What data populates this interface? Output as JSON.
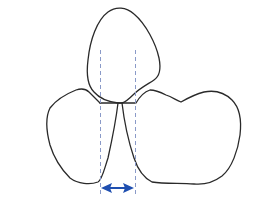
{
  "diagram": {
    "colors": {
      "outline": "#2a2a2a",
      "guide": "#8a9ac8",
      "arrow": "#1f4fb0",
      "background": "#ffffff"
    },
    "elements": [
      "top-lobe",
      "left-lobe",
      "right-lobe",
      "junction-line",
      "left-guide",
      "right-guide",
      "width-arrow"
    ]
  }
}
